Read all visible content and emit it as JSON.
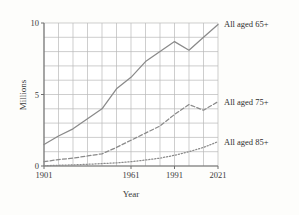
{
  "figure": {
    "background_color": "#fdfdfb",
    "grid_color": "#b9b9b9",
    "axis_color": "#6f6f6f",
    "text_color": "#3b3b3b"
  },
  "chart_data": {
    "type": "line",
    "title": "",
    "subtitle": "",
    "xlabel": "Year",
    "ylabel": "Millions",
    "xlim": [
      1901,
      2021
    ],
    "ylim": [
      0,
      10
    ],
    "grid": true,
    "grid_x_step": 10,
    "grid_y_step": 1,
    "legend_position": "right-inline",
    "xticks": [
      1901,
      1961,
      1991,
      2021
    ],
    "xtick_labels": [
      "1901",
      "1961",
      "1991",
      "2021"
    ],
    "yticks": [
      0,
      5,
      10
    ],
    "ytick_labels": [
      "0",
      "5",
      "10"
    ],
    "x": [
      1901,
      1911,
      1921,
      1931,
      1941,
      1951,
      1961,
      1971,
      1981,
      1991,
      2001,
      2011,
      2021
    ],
    "series": [
      {
        "name": "All aged 65+",
        "label": "All aged 65+",
        "style": "solid",
        "color": "#8a8a8a",
        "values": [
          1.5,
          2.1,
          2.6,
          3.3,
          4.0,
          5.4,
          6.2,
          7.3,
          8.0,
          8.7,
          8.1,
          9.0,
          9.9
        ]
      },
      {
        "name": "All aged 75+",
        "label": "All aged 75+",
        "style": "dashed",
        "color": "#8a8a8a",
        "values": [
          0.3,
          0.45,
          0.55,
          0.7,
          0.85,
          1.3,
          1.8,
          2.3,
          2.8,
          3.6,
          4.3,
          3.9,
          4.5
        ]
      },
      {
        "name": "All aged 85+",
        "label": "All aged 85+",
        "style": "dotted",
        "color": "#8a8a8a",
        "values": [
          0.02,
          0.05,
          0.08,
          0.12,
          0.17,
          0.22,
          0.3,
          0.42,
          0.55,
          0.75,
          1.0,
          1.3,
          1.7
        ]
      }
    ]
  }
}
